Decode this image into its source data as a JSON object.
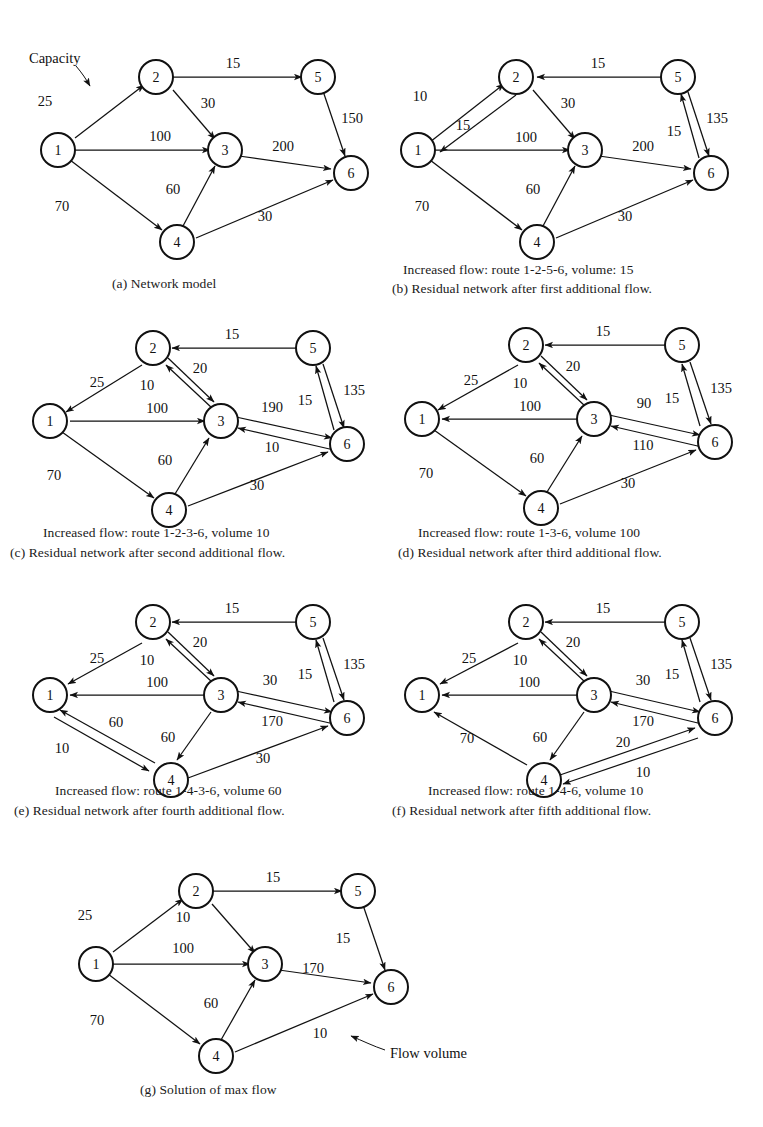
{
  "figure": {
    "node_labels": [
      "1",
      "2",
      "3",
      "4",
      "5",
      "6"
    ],
    "annotations": {
      "capacity_label": "Capacity",
      "flow_volume_label": "Flow volume"
    }
  },
  "panels": [
    {
      "id": "a",
      "caption": "(a)  Network model",
      "subcaption": "",
      "edges": [
        {
          "from": "1",
          "to": "2",
          "label": "25",
          "dir": "forward"
        },
        {
          "from": "2",
          "to": "5",
          "label": "15",
          "dir": "forward"
        },
        {
          "from": "2",
          "to": "3",
          "label": "30",
          "dir": "forward"
        },
        {
          "from": "1",
          "to": "3",
          "label": "100",
          "dir": "forward"
        },
        {
          "from": "5",
          "to": "6",
          "label": "150",
          "dir": "forward"
        },
        {
          "from": "3",
          "to": "6",
          "label": "200",
          "dir": "forward"
        },
        {
          "from": "1",
          "to": "4",
          "label": "70",
          "dir": "forward"
        },
        {
          "from": "4",
          "to": "3",
          "label": "60",
          "dir": "forward"
        },
        {
          "from": "4",
          "to": "6",
          "label": "30",
          "dir": "forward"
        }
      ]
    },
    {
      "id": "b",
      "caption": "(b) Residual network after first additional flow.",
      "subcaption": "Increased  flow:  route 1-2-5-6, volume: 15",
      "edges": [
        {
          "from": "1",
          "to": "2",
          "label": "10",
          "dir": "forward"
        },
        {
          "from": "2",
          "to": "1",
          "label": "15",
          "dir": "forward"
        },
        {
          "from": "5",
          "to": "2",
          "label": "15",
          "dir": "forward"
        },
        {
          "from": "2",
          "to": "3",
          "label": "30",
          "dir": "forward"
        },
        {
          "from": "1",
          "to": "3",
          "label": "100",
          "dir": "forward"
        },
        {
          "from": "6",
          "to": "5",
          "label": "15",
          "dir": "forward"
        },
        {
          "from": "5",
          "to": "6",
          "label": "135",
          "dir": "forward"
        },
        {
          "from": "3",
          "to": "6",
          "label": "200",
          "dir": "forward"
        },
        {
          "from": "1",
          "to": "4",
          "label": "70",
          "dir": "forward"
        },
        {
          "from": "4",
          "to": "3",
          "label": "60",
          "dir": "forward"
        },
        {
          "from": "4",
          "to": "6",
          "label": "30",
          "dir": "forward"
        }
      ]
    },
    {
      "id": "c",
      "caption": "(c) Residual network after second additional flow.",
      "subcaption": "Increased flow: route 1-2-3-6, volume 10",
      "edges": [
        {
          "from": "2",
          "to": "1",
          "label": "25",
          "dir": "forward"
        },
        {
          "from": "5",
          "to": "2",
          "label": "15",
          "dir": "forward"
        },
        {
          "from": "3",
          "to": "2",
          "label": "10",
          "dir": "forward"
        },
        {
          "from": "2",
          "to": "3",
          "label": "20",
          "dir": "forward"
        },
        {
          "from": "1",
          "to": "3",
          "label": "100",
          "dir": "forward"
        },
        {
          "from": "6",
          "to": "5",
          "label": "15",
          "dir": "forward"
        },
        {
          "from": "5",
          "to": "6",
          "label": "135",
          "dir": "forward"
        },
        {
          "from": "3",
          "to": "6",
          "label": "190",
          "dir": "forward"
        },
        {
          "from": "6",
          "to": "3",
          "label": "10",
          "dir": "forward"
        },
        {
          "from": "1",
          "to": "4",
          "label": "70",
          "dir": "forward"
        },
        {
          "from": "4",
          "to": "3",
          "label": "60",
          "dir": "forward"
        },
        {
          "from": "4",
          "to": "6",
          "label": "30",
          "dir": "forward"
        }
      ]
    },
    {
      "id": "d",
      "caption": "(d) Residual network after third additional flow.",
      "subcaption": "Increased flow: route 1-3-6, volume 100",
      "edges": [
        {
          "from": "2",
          "to": "1",
          "label": "25",
          "dir": "forward"
        },
        {
          "from": "5",
          "to": "2",
          "label": "15",
          "dir": "forward"
        },
        {
          "from": "3",
          "to": "2",
          "label": "10",
          "dir": "forward"
        },
        {
          "from": "2",
          "to": "3",
          "label": "20",
          "dir": "forward"
        },
        {
          "from": "3",
          "to": "1",
          "label": "100",
          "dir": "forward"
        },
        {
          "from": "6",
          "to": "5",
          "label": "15",
          "dir": "forward"
        },
        {
          "from": "5",
          "to": "6",
          "label": "135",
          "dir": "forward"
        },
        {
          "from": "3",
          "to": "6",
          "label": "90",
          "dir": "forward"
        },
        {
          "from": "6",
          "to": "3",
          "label": "110",
          "dir": "forward"
        },
        {
          "from": "1",
          "to": "4",
          "label": "70",
          "dir": "forward"
        },
        {
          "from": "4",
          "to": "3",
          "label": "60",
          "dir": "forward"
        },
        {
          "from": "4",
          "to": "6",
          "label": "30",
          "dir": "forward"
        }
      ]
    },
    {
      "id": "e",
      "caption": "(e) Residual network after fourth additional flow.",
      "subcaption": "Increased flow: route 1-4-3-6,  volume 60",
      "edges": [
        {
          "from": "2",
          "to": "1",
          "label": "25",
          "dir": "forward"
        },
        {
          "from": "5",
          "to": "2",
          "label": "15",
          "dir": "forward"
        },
        {
          "from": "3",
          "to": "2",
          "label": "10",
          "dir": "forward"
        },
        {
          "from": "2",
          "to": "3",
          "label": "20",
          "dir": "forward"
        },
        {
          "from": "3",
          "to": "1",
          "label": "100",
          "dir": "forward"
        },
        {
          "from": "6",
          "to": "5",
          "label": "15",
          "dir": "forward"
        },
        {
          "from": "5",
          "to": "6",
          "label": "135",
          "dir": "forward"
        },
        {
          "from": "3",
          "to": "6",
          "label": "30",
          "dir": "forward"
        },
        {
          "from": "6",
          "to": "3",
          "label": "170",
          "dir": "forward"
        },
        {
          "from": "4",
          "to": "1",
          "label": "60",
          "dir": "forward"
        },
        {
          "from": "1",
          "to": "4",
          "label": "10",
          "dir": "forward"
        },
        {
          "from": "3",
          "to": "4",
          "label": "60",
          "dir": "forward"
        },
        {
          "from": "4",
          "to": "6",
          "label": "30",
          "dir": "forward"
        }
      ]
    },
    {
      "id": "f",
      "caption": "(f)  Residual network after fifth additional flow.",
      "subcaption": "Increased flow:  route 1-4-6, volume 10",
      "edges": [
        {
          "from": "2",
          "to": "1",
          "label": "25",
          "dir": "forward"
        },
        {
          "from": "5",
          "to": "2",
          "label": "15",
          "dir": "forward"
        },
        {
          "from": "3",
          "to": "2",
          "label": "10",
          "dir": "forward"
        },
        {
          "from": "2",
          "to": "3",
          "label": "20",
          "dir": "forward"
        },
        {
          "from": "3",
          "to": "1",
          "label": "100",
          "dir": "forward"
        },
        {
          "from": "6",
          "to": "5",
          "label": "15",
          "dir": "forward"
        },
        {
          "from": "5",
          "to": "6",
          "label": "135",
          "dir": "forward"
        },
        {
          "from": "3",
          "to": "6",
          "label": "30",
          "dir": "forward"
        },
        {
          "from": "6",
          "to": "3",
          "label": "170",
          "dir": "forward"
        },
        {
          "from": "4",
          "to": "1",
          "label": "70",
          "dir": "forward"
        },
        {
          "from": "3",
          "to": "4",
          "label": "60",
          "dir": "forward"
        },
        {
          "from": "4",
          "to": "6",
          "label": "20",
          "dir": "forward"
        },
        {
          "from": "6",
          "to": "4",
          "label": "10",
          "dir": "forward"
        }
      ]
    },
    {
      "id": "g",
      "caption": "(g)  Solution of max flow",
      "subcaption": "",
      "edges": [
        {
          "from": "1",
          "to": "2",
          "label": "25",
          "dir": "forward"
        },
        {
          "from": "2",
          "to": "5",
          "label": "15",
          "dir": "forward"
        },
        {
          "from": "2",
          "to": "3",
          "label": "10",
          "dir": "forward"
        },
        {
          "from": "1",
          "to": "3",
          "label": "100",
          "dir": "forward"
        },
        {
          "from": "5",
          "to": "6",
          "label": "15",
          "dir": "forward"
        },
        {
          "from": "3",
          "to": "6",
          "label": "170",
          "dir": "forward"
        },
        {
          "from": "1",
          "to": "4",
          "label": "70",
          "dir": "forward"
        },
        {
          "from": "4",
          "to": "3",
          "label": "60",
          "dir": "forward"
        },
        {
          "from": "4",
          "to": "6",
          "label": "10",
          "dir": "forward"
        }
      ]
    }
  ]
}
